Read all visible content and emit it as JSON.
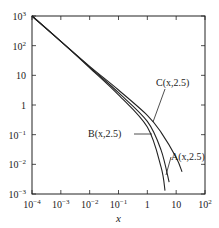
{
  "chart_data": {
    "type": "line",
    "title": "",
    "xlabel": "x",
    "ylabel": "",
    "xscale": "log",
    "yscale": "log",
    "xlim": [
      0.0001,
      100
    ],
    "ylim": [
      0.001,
      1000
    ],
    "grid": false,
    "x_ticks": [
      "10^-4",
      "10^-3",
      "10^-2",
      "10^-1",
      "1",
      "10",
      "10^2"
    ],
    "y_ticks": [
      "10^-3",
      "10^-2",
      "10^-1",
      "1",
      "10",
      "10^2",
      "10^3"
    ],
    "series": [
      {
        "name": "C(x,2.5)",
        "x": [
          0.0001,
          0.001,
          0.01,
          0.1,
          1,
          3,
          10,
          16
        ],
        "y": [
          1000,
          140,
          20,
          3.2,
          0.45,
          0.12,
          0.017,
          0.0056
        ]
      },
      {
        "name": "A(x,2.5)",
        "x": [
          0.0001,
          0.001,
          0.01,
          0.1,
          1,
          3,
          5.7
        ],
        "y": [
          1000,
          140,
          19,
          2.6,
          0.28,
          0.03,
          0.0025
        ]
      },
      {
        "name": "B(x,2.5)",
        "x": [
          0.0001,
          0.001,
          0.01,
          0.1,
          1,
          3,
          4.1
        ],
        "y": [
          1000,
          140,
          18,
          2.2,
          0.18,
          0.008,
          0.0013
        ]
      }
    ],
    "annotations": [
      "C(x,2.5)",
      "B(x,2.5)",
      "A(x,2.5)"
    ]
  },
  "labels": {
    "x_axis_title": "x",
    "curve_c": "C(x,2.5)",
    "curve_b": "B(x,2.5)",
    "curve_a": "A(x,2.5)",
    "xticks": [
      {
        "base": "10",
        "exp": "−4"
      },
      {
        "base": "10",
        "exp": "−3"
      },
      {
        "base": "10",
        "exp": "−2"
      },
      {
        "base": "10",
        "exp": "−1"
      },
      {
        "base": "1",
        "exp": ""
      },
      {
        "base": "10",
        "exp": ""
      },
      {
        "base": "10",
        "exp": "2"
      }
    ],
    "yticks": [
      {
        "base": "10",
        "exp": "3"
      },
      {
        "base": "10",
        "exp": "2"
      },
      {
        "base": "10",
        "exp": ""
      },
      {
        "base": "1",
        "exp": ""
      },
      {
        "base": "10",
        "exp": "−1"
      },
      {
        "base": "10",
        "exp": "−2"
      },
      {
        "base": "10",
        "exp": "−3"
      }
    ]
  }
}
